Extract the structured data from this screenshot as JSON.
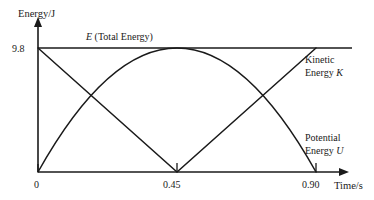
{
  "chart_data": {
    "type": "line",
    "title": "",
    "xlabel": "Time/s",
    "ylabel": "Energy/J",
    "xlim": [
      0,
      0.9
    ],
    "ylim": [
      0,
      9.8
    ],
    "grid": false,
    "legend_position": "inline-right",
    "x_ticks": [
      "0",
      "0.45",
      "0.90"
    ],
    "x_tick_values": [
      0,
      0.45,
      0.9
    ],
    "y_ticks": [
      "9.8"
    ],
    "y_tick_values": [
      9.8
    ],
    "annotations": [
      "E (Total Energy)"
    ],
    "series": [
      {
        "name": "E (Total Energy)",
        "shape": "horizontal-constant",
        "x": [
          0,
          0.45,
          0.9
        ],
        "values": [
          9.8,
          9.8,
          9.8
        ]
      },
      {
        "name": "Kinetic Energy K",
        "shape": "v-linear",
        "x": [
          0,
          0.45,
          0.9
        ],
        "values": [
          9.8,
          0,
          9.8
        ]
      },
      {
        "name": "Potential Energy U",
        "shape": "parabola-peak",
        "x": [
          0,
          0.45,
          0.9
        ],
        "values": [
          0,
          9.8,
          0
        ]
      }
    ]
  },
  "axes": {
    "y_axis_label": "Energy/J",
    "x_axis_label": "Time/s",
    "y_max_label": "9.8",
    "x_tick_0": "0",
    "x_tick_mid": "0.45",
    "x_tick_end": "0.90"
  },
  "annotations": {
    "total_energy": {
      "symbol": "E",
      "text": " (Total Energy)"
    },
    "kinetic": {
      "line1": "Kinetic",
      "line2": "Energy ",
      "symbol": "K"
    },
    "potential": {
      "line1": "Potential",
      "line2": "Energy ",
      "symbol": "U"
    }
  },
  "colors": {
    "ink": "#1a1a1a",
    "background": "#ffffff"
  }
}
